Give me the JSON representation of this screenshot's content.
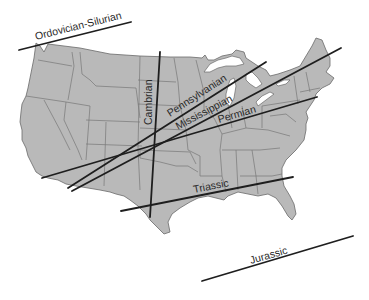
{
  "diagram": {
    "colors": {
      "land": "#b9b9b9",
      "state_border": "#6a6a6a",
      "line": "#1e1e1e",
      "label": "#2a2a2a",
      "background": "#ffffff"
    },
    "lines": [
      {
        "id": "ordovician-silurian",
        "label": "Ordovician-Silurian",
        "x1": 19,
        "y1": 50,
        "x2": 131,
        "y2": 22,
        "label_x": 36,
        "label_y": 40,
        "label_angle": -14
      },
      {
        "id": "cambrian",
        "label": "Cambrian",
        "x1": 160,
        "y1": 52,
        "x2": 150,
        "y2": 217,
        "label_x": 152,
        "label_y": 125,
        "label_angle": -90
      },
      {
        "id": "pennsylvanian",
        "label": "Pennsylvanian",
        "x1": 68,
        "y1": 188,
        "x2": 266,
        "y2": 62,
        "label_x": 170,
        "label_y": 117,
        "label_angle": -33
      },
      {
        "id": "mississippian",
        "label": "Mississippian",
        "x1": 72,
        "y1": 191,
        "x2": 341,
        "y2": 48,
        "label_x": 178,
        "label_y": 130,
        "label_angle": -28
      },
      {
        "id": "permian",
        "label": "Permian",
        "x1": 42,
        "y1": 178,
        "x2": 317,
        "y2": 97,
        "label_x": 219,
        "label_y": 123,
        "label_angle": -16
      },
      {
        "id": "triassic",
        "label": "Triassic",
        "x1": 121,
        "y1": 211,
        "x2": 293,
        "y2": 177,
        "label_x": 194,
        "label_y": 193,
        "label_angle": -11
      },
      {
        "id": "jurassic",
        "label": "Jurassic",
        "x1": 202,
        "y1": 281,
        "x2": 353,
        "y2": 236,
        "label_x": 251,
        "label_y": 264,
        "label_angle": -16
      }
    ]
  }
}
